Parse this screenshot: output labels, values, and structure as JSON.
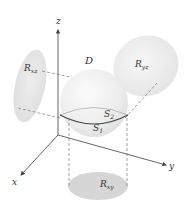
{
  "diagram": {
    "axes": {
      "x_label": "x",
      "y_label": "y",
      "z_label": "z"
    },
    "solid": {
      "label": "D",
      "upper_surface_label": "S",
      "upper_surface_sub": "2",
      "lower_surface_label": "S",
      "lower_surface_sub": "1"
    },
    "projections": {
      "xz": {
        "label": "R",
        "sub": "xz"
      },
      "yz": {
        "label": "R",
        "sub": "yz"
      },
      "xy": {
        "label": "R",
        "sub": "xy"
      }
    },
    "colors": {
      "projection_fill": "#d9d9d9",
      "projection_fill_light": "#ececec",
      "sphere_fill": "#eeeeee",
      "axis": "#555555",
      "equator": "#444444",
      "dashed": "#777777"
    }
  }
}
